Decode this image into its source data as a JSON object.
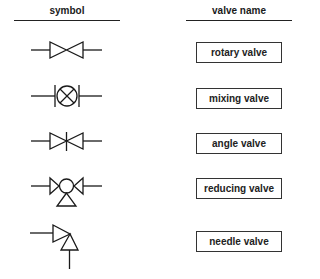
{
  "headers": {
    "symbol": "symbol",
    "valve_name": "valve name"
  },
  "rows": [
    {
      "name": "rotary valve",
      "symbol_icon": "rotary-valve-symbol"
    },
    {
      "name": "mixing valve",
      "symbol_icon": "mixing-valve-symbol"
    },
    {
      "name": "angle valve",
      "symbol_icon": "angle-valve-symbol"
    },
    {
      "name": "reducing valve",
      "symbol_icon": "reducing-valve-symbol"
    },
    {
      "name": "needle valve",
      "symbol_icon": "needle-valve-symbol"
    }
  ],
  "colors": {
    "stroke": "#1a1a1a",
    "background": "#ffffff"
  }
}
